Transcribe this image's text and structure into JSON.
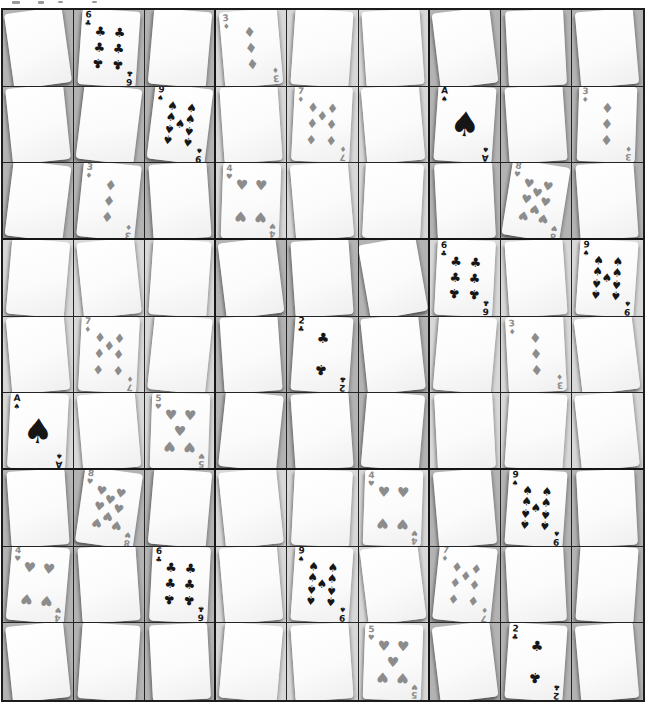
{
  "board": {
    "rows": 9,
    "cols": 9,
    "colors": {
      "block_dark": "#b3b3b3",
      "block_light": "#d8d8d8",
      "grid_line": "#1c1c1c",
      "card_face": "#fbfbfb",
      "black_suit": "#161616",
      "red_suit_printed_gray": "#8c8c8c",
      "page_background": "#ffffff"
    },
    "suits": {
      "S": {
        "name": "spades",
        "glyph": "♠",
        "color_key": "black_suit"
      },
      "C": {
        "name": "clubs",
        "glyph": "♣",
        "color_key": "black_suit"
      },
      "H": {
        "name": "hearts",
        "glyph": "♥",
        "color_key": "red_suit_printed_gray"
      },
      "D": {
        "name": "diamonds",
        "glyph": "♦",
        "color_key": "red_suit_printed_gray"
      }
    },
    "face_up_cards": [
      {
        "rank": "6",
        "suit": "C",
        "row": 1,
        "col": 2
      },
      {
        "rank": "3",
        "suit": "D",
        "row": 1,
        "col": 4
      },
      {
        "rank": "9",
        "suit": "S",
        "row": 2,
        "col": 3
      },
      {
        "rank": "7",
        "suit": "D",
        "row": 2,
        "col": 5
      },
      {
        "rank": "A",
        "suit": "S",
        "row": 2,
        "col": 7
      },
      {
        "rank": "3",
        "suit": "D",
        "row": 2,
        "col": 9
      },
      {
        "rank": "3",
        "suit": "D",
        "row": 3,
        "col": 2
      },
      {
        "rank": "4",
        "suit": "H",
        "row": 3,
        "col": 4
      },
      {
        "rank": "8",
        "suit": "H",
        "row": 3,
        "col": 8
      },
      {
        "rank": "6",
        "suit": "C",
        "row": 4,
        "col": 7
      },
      {
        "rank": "9",
        "suit": "S",
        "row": 4,
        "col": 9
      },
      {
        "rank": "7",
        "suit": "D",
        "row": 5,
        "col": 2
      },
      {
        "rank": "2",
        "suit": "C",
        "row": 5,
        "col": 5
      },
      {
        "rank": "3",
        "suit": "D",
        "row": 5,
        "col": 8
      },
      {
        "rank": "A",
        "suit": "S",
        "row": 6,
        "col": 1
      },
      {
        "rank": "5",
        "suit": "H",
        "row": 6,
        "col": 3
      },
      {
        "rank": "8",
        "suit": "H",
        "row": 7,
        "col": 2
      },
      {
        "rank": "4",
        "suit": "H",
        "row": 7,
        "col": 6
      },
      {
        "rank": "9",
        "suit": "S",
        "row": 7,
        "col": 8
      },
      {
        "rank": "4",
        "suit": "H",
        "row": 8,
        "col": 1
      },
      {
        "rank": "6",
        "suit": "C",
        "row": 8,
        "col": 3
      },
      {
        "rank": "9",
        "suit": "S",
        "row": 8,
        "col": 5
      },
      {
        "rank": "7",
        "suit": "D",
        "row": 8,
        "col": 7
      },
      {
        "rank": "5",
        "suit": "H",
        "row": 9,
        "col": 6
      },
      {
        "rank": "2",
        "suit": "C",
        "row": 9,
        "col": 8
      }
    ],
    "cells": [
      {
        "r": 1,
        "c": 1,
        "card": "down",
        "rot": -8
      },
      {
        "r": 1,
        "c": 2,
        "card": "6C",
        "rot": 4
      },
      {
        "r": 1,
        "c": 3,
        "card": "down",
        "rot": 5
      },
      {
        "r": 1,
        "c": 4,
        "card": "3D",
        "rot": -5
      },
      {
        "r": 1,
        "c": 5,
        "card": "down",
        "rot": 4
      },
      {
        "r": 1,
        "c": 6,
        "card": "down",
        "rot": -4
      },
      {
        "r": 1,
        "c": 7,
        "card": "down",
        "rot": -7
      },
      {
        "r": 1,
        "c": 8,
        "card": "down",
        "rot": -3
      },
      {
        "r": 1,
        "c": 9,
        "card": "down",
        "rot": -5
      },
      {
        "r": 2,
        "c": 1,
        "card": "down",
        "rot": -6
      },
      {
        "r": 2,
        "c": 2,
        "card": "down",
        "rot": 7
      },
      {
        "r": 2,
        "c": 3,
        "card": "9S",
        "rot": 7
      },
      {
        "r": 2,
        "c": 4,
        "card": "down",
        "rot": -4
      },
      {
        "r": 2,
        "c": 5,
        "card": "7D",
        "rot": 3
      },
      {
        "r": 2,
        "c": 6,
        "card": "down",
        "rot": -5
      },
      {
        "r": 2,
        "c": 7,
        "card": "AS",
        "rot": 4
      },
      {
        "r": 2,
        "c": 8,
        "card": "down",
        "rot": -4
      },
      {
        "r": 2,
        "c": 9,
        "card": "3D",
        "rot": 2
      },
      {
        "r": 3,
        "c": 1,
        "card": "down",
        "rot": 7
      },
      {
        "r": 3,
        "c": 2,
        "card": "3D",
        "rot": 6
      },
      {
        "r": 3,
        "c": 3,
        "card": "down",
        "rot": -4
      },
      {
        "r": 3,
        "c": 4,
        "card": "4H",
        "rot": 2
      },
      {
        "r": 3,
        "c": 5,
        "card": "down",
        "rot": -5
      },
      {
        "r": 3,
        "c": 6,
        "card": "down",
        "rot": 3
      },
      {
        "r": 3,
        "c": 7,
        "card": "down",
        "rot": -3
      },
      {
        "r": 3,
        "c": 8,
        "card": "8H",
        "rot": 9
      },
      {
        "r": 3,
        "c": 9,
        "card": "down",
        "rot": -4
      },
      {
        "r": 4,
        "c": 1,
        "card": "down",
        "rot": 5
      },
      {
        "r": 4,
        "c": 2,
        "card": "down",
        "rot": -6
      },
      {
        "r": 4,
        "c": 3,
        "card": "down",
        "rot": 4
      },
      {
        "r": 4,
        "c": 4,
        "card": "down",
        "rot": -7
      },
      {
        "r": 4,
        "c": 5,
        "card": "down",
        "rot": -4
      },
      {
        "r": 4,
        "c": 6,
        "card": "down",
        "rot": -10
      },
      {
        "r": 4,
        "c": 7,
        "card": "6C",
        "rot": 3
      },
      {
        "r": 4,
        "c": 8,
        "card": "down",
        "rot": -4
      },
      {
        "r": 4,
        "c": 9,
        "card": "9S",
        "rot": 4
      },
      {
        "r": 5,
        "c": 1,
        "card": "down",
        "rot": -5
      },
      {
        "r": 5,
        "c": 2,
        "card": "7D",
        "rot": 3
      },
      {
        "r": 5,
        "c": 3,
        "card": "down",
        "rot": 6
      },
      {
        "r": 5,
        "c": 4,
        "card": "down",
        "rot": -4
      },
      {
        "r": 5,
        "c": 5,
        "card": "2C",
        "rot": 4
      },
      {
        "r": 5,
        "c": 6,
        "card": "down",
        "rot": -6
      },
      {
        "r": 5,
        "c": 7,
        "card": "down",
        "rot": 5
      },
      {
        "r": 5,
        "c": 8,
        "card": "3D",
        "rot": -3
      },
      {
        "r": 5,
        "c": 9,
        "card": "down",
        "rot": -7
      },
      {
        "r": 6,
        "c": 1,
        "card": "AS",
        "rot": 3
      },
      {
        "r": 6,
        "c": 2,
        "card": "down",
        "rot": -5
      },
      {
        "r": 6,
        "c": 3,
        "card": "5H",
        "rot": 2
      },
      {
        "r": 6,
        "c": 4,
        "card": "down",
        "rot": 6
      },
      {
        "r": 6,
        "c": 5,
        "card": "down",
        "rot": -4
      },
      {
        "r": 6,
        "c": 6,
        "card": "down",
        "rot": 5
      },
      {
        "r": 6,
        "c": 7,
        "card": "down",
        "rot": -3
      },
      {
        "r": 6,
        "c": 8,
        "card": "down",
        "rot": 4
      },
      {
        "r": 6,
        "c": 9,
        "card": "down",
        "rot": -6
      },
      {
        "r": 7,
        "c": 1,
        "card": "down",
        "rot": -4
      },
      {
        "r": 7,
        "c": 2,
        "card": "8H",
        "rot": 8
      },
      {
        "r": 7,
        "c": 3,
        "card": "down",
        "rot": 5
      },
      {
        "r": 7,
        "c": 4,
        "card": "down",
        "rot": -6
      },
      {
        "r": 7,
        "c": 5,
        "card": "down",
        "rot": 3
      },
      {
        "r": 7,
        "c": 6,
        "card": "4H",
        "rot": 2
      },
      {
        "r": 7,
        "c": 7,
        "card": "down",
        "rot": -5
      },
      {
        "r": 7,
        "c": 8,
        "card": "9S",
        "rot": 4
      },
      {
        "r": 7,
        "c": 9,
        "card": "down",
        "rot": -3
      },
      {
        "r": 8,
        "c": 1,
        "card": "4H",
        "rot": 5
      },
      {
        "r": 8,
        "c": 2,
        "card": "down",
        "rot": -4
      },
      {
        "r": 8,
        "c": 3,
        "card": "6C",
        "rot": 3
      },
      {
        "r": 8,
        "c": 4,
        "card": "down",
        "rot": -5
      },
      {
        "r": 8,
        "c": 5,
        "card": "9S",
        "rot": 4
      },
      {
        "r": 8,
        "c": 6,
        "card": "down",
        "rot": -7
      },
      {
        "r": 8,
        "c": 7,
        "card": "7D",
        "rot": 6
      },
      {
        "r": 8,
        "c": 8,
        "card": "down",
        "rot": -3
      },
      {
        "r": 8,
        "c": 9,
        "card": "down",
        "rot": 4
      },
      {
        "r": 9,
        "c": 1,
        "card": "down",
        "rot": -6
      },
      {
        "r": 9,
        "c": 2,
        "card": "down",
        "rot": 4
      },
      {
        "r": 9,
        "c": 3,
        "card": "down",
        "rot": -3
      },
      {
        "r": 9,
        "c": 4,
        "card": "down",
        "rot": 5
      },
      {
        "r": 9,
        "c": 5,
        "card": "down",
        "rot": -4
      },
      {
        "r": 9,
        "c": 6,
        "card": "5H",
        "rot": 2
      },
      {
        "r": 9,
        "c": 7,
        "card": "down",
        "rot": -7
      },
      {
        "r": 9,
        "c": 8,
        "card": "2C",
        "rot": 4
      },
      {
        "r": 9,
        "c": 9,
        "card": "down",
        "rot": -5
      }
    ]
  }
}
